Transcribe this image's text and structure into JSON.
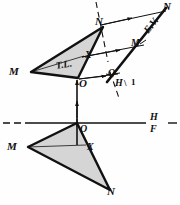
{
  "figure": {
    "fill_color": "#d5d5d5",
    "line_color": "#111111",
    "background": "#fefefe"
  },
  "labels": {
    "top_view": {
      "M": "M",
      "N": "N",
      "O": "O",
      "X": "X",
      "true_length": "T.L."
    },
    "front_view": {
      "M": "M",
      "N": "N",
      "O": "O",
      "X": "X"
    },
    "auxiliary_view": {
      "N": "N",
      "M": "M",
      "O": "O",
      "edge_view": "E.V."
    },
    "fold_lines": {
      "hf_top": "H",
      "hf_bottom": "F",
      "h1_left": "H",
      "h1_sep": "\\",
      "h1_right": "1"
    }
  },
  "geometry": {
    "top_view_triangle": [
      [
        31,
        72
      ],
      [
        103,
        27
      ],
      [
        78,
        78
      ]
    ],
    "front_view_triangle": [
      [
        28,
        147
      ],
      [
        77,
        123
      ],
      [
        110,
        190
      ]
    ],
    "aux_view_triangle_line": [
      [
        165,
        8
      ],
      [
        103,
        81
      ]
    ],
    "hf_reference_line_y": 123,
    "h1_fold_line": [
      [
        97,
        3
      ],
      [
        114,
        97
      ]
    ]
  }
}
